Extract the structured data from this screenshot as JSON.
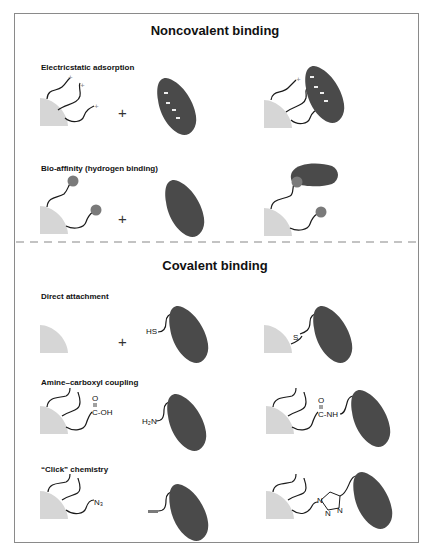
{
  "sections": {
    "noncovalent": {
      "title": "Noncovalent binding"
    },
    "covalent": {
      "title": "Covalent binding"
    }
  },
  "rows": [
    {
      "id": "electrostatic",
      "label": "Electricstatic adsorption",
      "operator": "+",
      "charge_symbol": "+"
    },
    {
      "id": "bioaffinity",
      "label": "Bio-affinity (hydrogen binding)",
      "operator": "+"
    },
    {
      "id": "direct",
      "label": "Direct attachment",
      "operator": "+",
      "reactant_group": "HS",
      "product_link": "S"
    },
    {
      "id": "amine",
      "label": "Amine–carboxyl coupling",
      "carboxyl_o": "O",
      "carboxyl_group": "C-OH",
      "reactant_group": "H₂N",
      "product_o": "O",
      "product_link": "C-NH"
    },
    {
      "id": "click",
      "label": "“Click” chemistry",
      "azide_group": "N₃",
      "triazole_n1": "N",
      "triazole_n2": "N",
      "triazole_n3": "N"
    }
  ],
  "colors": {
    "frame": "#8a8a8a",
    "surface": "#d6d6d6",
    "protein": "#4a4a4a",
    "ligand": "#7a7a7a",
    "linker": "#1a1a1a",
    "separator": "#888888"
  }
}
